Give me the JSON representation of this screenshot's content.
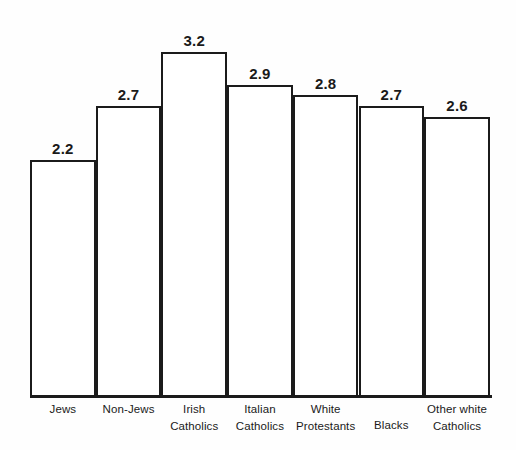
{
  "chart_data": {
    "type": "bar",
    "title": "",
    "subtitle": "",
    "xlabel": "",
    "ylabel": "",
    "ylim": [
      0,
      3.5
    ],
    "grid": false,
    "legend": false,
    "orientation": "vertical",
    "bar_style": "outlined-adjacent",
    "categories": [
      "Jews",
      "Non-Jews",
      "Irish Catholics",
      "Italian Catholics",
      "White Protestants",
      "Blacks",
      "Other white Catholics"
    ],
    "category_lines": [
      [
        "Jews"
      ],
      [
        "Non-Jews"
      ],
      [
        "Irish",
        "Catholics"
      ],
      [
        "Italian",
        "Catholics"
      ],
      [
        "White",
        "Protestants"
      ],
      [
        "Blacks"
      ],
      [
        "Other white",
        "Catholics"
      ]
    ],
    "values": [
      2.2,
      2.7,
      3.2,
      2.9,
      2.8,
      2.7,
      2.6
    ],
    "value_labels": [
      "2.2",
      "2.7",
      "3.2",
      "2.9",
      "2.8",
      "2.7",
      "2.6"
    ],
    "colors": {
      "bar_fill": "#ffffff",
      "bar_outline": "#1b1b1b",
      "axis": "#1b1b1b",
      "text": "#1a1a1a",
      "background": "#fefefe"
    }
  }
}
